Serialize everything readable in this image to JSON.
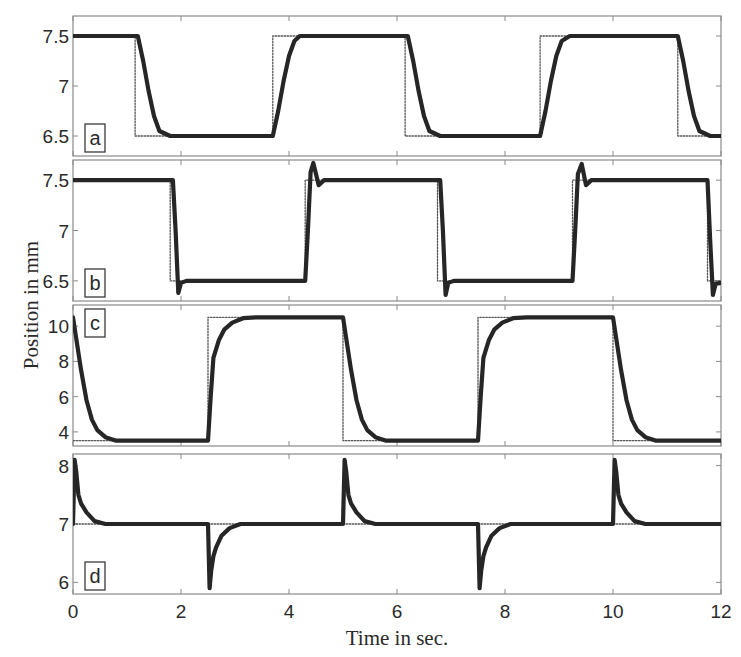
{
  "chart_data": {
    "type": "line",
    "xlabel": "Time in sec.",
    "ylabel": "Position in mm",
    "xlim": [
      0,
      12
    ],
    "xticks": [
      0,
      2,
      4,
      6,
      8,
      10,
      12
    ],
    "xtick_labels": [
      "0",
      "2",
      "4",
      "6",
      "8",
      "10",
      "12"
    ],
    "grid": false,
    "legend": null,
    "panels": [
      {
        "label": "a",
        "ylim": [
          6.3,
          7.7
        ],
        "yticks": [
          6.5,
          7,
          7.5
        ],
        "ytick_labels": [
          "6.5",
          "7",
          "7.5"
        ],
        "series": [
          {
            "name": "reference (dotted)",
            "style": "dotted",
            "x": [
              0,
              1.15,
              1.15,
              3.7,
              3.7,
              6.15,
              6.15,
              8.65,
              8.65,
              11.2,
              11.2,
              12
            ],
            "y": [
              7.5,
              7.5,
              6.5,
              6.5,
              7.5,
              7.5,
              6.5,
              6.5,
              7.5,
              7.5,
              6.5,
              6.5
            ]
          },
          {
            "name": "measured position (solid)",
            "style": "solid",
            "x": [
              0,
              1.2,
              1.3,
              1.4,
              1.5,
              1.6,
              1.8,
              3.7,
              3.8,
              3.9,
              4.0,
              4.1,
              4.2,
              6.2,
              6.3,
              6.4,
              6.5,
              6.6,
              6.8,
              8.65,
              8.75,
              8.85,
              8.95,
              9.05,
              9.2,
              11.2,
              11.3,
              11.4,
              11.5,
              11.6,
              11.8,
              12
            ],
            "y": [
              7.5,
              7.5,
              7.25,
              6.95,
              6.7,
              6.55,
              6.5,
              6.5,
              6.75,
              7.05,
              7.3,
              7.45,
              7.5,
              7.5,
              7.25,
              6.95,
              6.7,
              6.55,
              6.5,
              6.5,
              6.75,
              7.05,
              7.3,
              7.45,
              7.5,
              7.5,
              7.25,
              6.95,
              6.7,
              6.55,
              6.5,
              6.5
            ]
          }
        ]
      },
      {
        "label": "b",
        "ylim": [
          6.3,
          7.7
        ],
        "yticks": [
          6.5,
          7,
          7.5
        ],
        "ytick_labels": [
          "6.5",
          "7",
          "7.5"
        ],
        "series": [
          {
            "name": "reference (dotted)",
            "style": "dotted",
            "x": [
              0,
              1.8,
              1.8,
              4.3,
              4.3,
              6.75,
              6.75,
              9.25,
              9.25,
              11.75,
              11.75,
              12
            ],
            "y": [
              7.5,
              7.5,
              6.5,
              6.5,
              7.5,
              7.5,
              6.5,
              6.5,
              7.5,
              7.5,
              6.5,
              6.5
            ]
          },
          {
            "name": "measured position (solid)",
            "style": "solid",
            "x": [
              0,
              1.85,
              1.9,
              1.95,
              2.0,
              2.1,
              4.3,
              4.35,
              4.4,
              4.45,
              4.55,
              4.65,
              6.8,
              6.85,
              6.9,
              6.95,
              7.05,
              9.25,
              9.3,
              9.35,
              9.42,
              9.5,
              9.6,
              11.75,
              11.8,
              11.85,
              11.9,
              12
            ],
            "y": [
              7.5,
              7.5,
              7.0,
              6.38,
              6.48,
              6.5,
              6.5,
              7.0,
              7.58,
              7.67,
              7.45,
              7.5,
              7.5,
              7.0,
              6.36,
              6.48,
              6.5,
              6.5,
              7.0,
              7.56,
              7.66,
              7.45,
              7.5,
              7.5,
              6.9,
              6.36,
              6.47,
              6.48
            ]
          }
        ]
      },
      {
        "label": "c",
        "ylim": [
          3.2,
          11.2
        ],
        "yticks": [
          4,
          6,
          8,
          10
        ],
        "ytick_labels": [
          "4",
          "6",
          "8",
          "10"
        ],
        "series": [
          {
            "name": "reference (dotted)",
            "style": "dotted",
            "x": [
              0,
              2.5,
              2.5,
              5.0,
              5.0,
              7.5,
              7.5,
              10.0,
              10.0,
              12
            ],
            "y": [
              3.5,
              3.5,
              10.5,
              10.5,
              3.5,
              3.5,
              10.5,
              10.5,
              3.5,
              3.5
            ]
          },
          {
            "name": "measured position (solid)",
            "style": "solid",
            "x": [
              0,
              0.05,
              0.15,
              0.25,
              0.35,
              0.45,
              0.6,
              0.8,
              2.5,
              2.55,
              2.6,
              2.7,
              2.8,
              2.95,
              3.15,
              3.4,
              5.0,
              5.05,
              5.15,
              5.25,
              5.35,
              5.45,
              5.6,
              5.8,
              7.5,
              7.55,
              7.6,
              7.7,
              7.8,
              7.95,
              8.15,
              8.4,
              10.0,
              10.05,
              10.15,
              10.25,
              10.35,
              10.45,
              10.6,
              10.8,
              12
            ],
            "y": [
              10.5,
              9.5,
              7.5,
              5.8,
              4.7,
              4.1,
              3.7,
              3.5,
              3.5,
              6.0,
              8.2,
              9.2,
              9.8,
              10.2,
              10.45,
              10.5,
              10.5,
              9.5,
              7.5,
              5.8,
              4.7,
              4.1,
              3.7,
              3.5,
              3.5,
              6.0,
              8.2,
              9.2,
              9.8,
              10.2,
              10.45,
              10.5,
              10.5,
              9.5,
              7.5,
              5.8,
              4.7,
              4.1,
              3.7,
              3.5,
              3.5
            ]
          }
        ]
      },
      {
        "label": "d",
        "ylim": [
          5.8,
          8.2
        ],
        "yticks": [
          6,
          7,
          8
        ],
        "ytick_labels": [
          "6",
          "7",
          "8"
        ],
        "series": [
          {
            "name": "reference (dotted)",
            "style": "dotted",
            "x": [
              0,
              12
            ],
            "y": [
              7,
              7
            ]
          },
          {
            "name": "measured position (solid)",
            "style": "solid",
            "x": [
              0,
              0.03,
              0.06,
              0.1,
              0.15,
              0.25,
              0.4,
              0.6,
              2.5,
              2.53,
              2.56,
              2.6,
              2.65,
              2.75,
              2.9,
              3.1,
              5.0,
              5.03,
              5.06,
              5.1,
              5.15,
              5.25,
              5.4,
              5.6,
              7.5,
              7.53,
              7.56,
              7.6,
              7.65,
              7.75,
              7.9,
              8.1,
              10.0,
              10.03,
              10.06,
              10.1,
              10.15,
              10.25,
              10.4,
              10.6,
              12
            ],
            "y": [
              7.0,
              8.1,
              7.9,
              7.5,
              7.35,
              7.2,
              7.05,
              7.0,
              7.0,
              5.9,
              6.2,
              6.45,
              6.6,
              6.8,
              6.93,
              7.0,
              7.0,
              8.1,
              7.9,
              7.5,
              7.35,
              7.2,
              7.05,
              7.0,
              7.0,
              5.9,
              6.2,
              6.45,
              6.6,
              6.8,
              6.93,
              7.0,
              7.0,
              8.1,
              7.9,
              7.5,
              7.35,
              7.2,
              7.05,
              7.0,
              7.0
            ]
          }
        ]
      }
    ]
  },
  "colors": {
    "measured_line": "#262626",
    "reference_line": "#555555",
    "axes": "#8a8a8a",
    "text": "#2a2a2a",
    "background": "#ffffff"
  }
}
